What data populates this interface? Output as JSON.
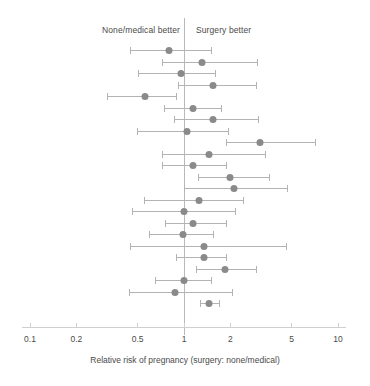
{
  "chart_data": {
    "type": "scatter",
    "subtype": "forest-plot",
    "title": "",
    "xlabel": "Relative risk of pregnancy (surgery: none/medical)",
    "ylabel": "",
    "xscale": "log",
    "xlim": [
      0.1,
      10
    ],
    "xticks": [
      0.1,
      0.2,
      0.5,
      1,
      2,
      5,
      10
    ],
    "xticklabels": [
      "0.1",
      "0.2",
      "0.5",
      "1",
      "2",
      "5",
      "10"
    ],
    "grid": false,
    "legend": "none",
    "reference_line": 1,
    "annotations": [
      {
        "text": "None/medical better",
        "side": "left"
      },
      {
        "text": "Surgery better",
        "side": "right"
      }
    ],
    "marker_color": "#8a8a8a",
    "whisker_color": "#b3b3b3",
    "point_label": "Relative risk",
    "interval_label": "95% confidence interval",
    "points": [
      {
        "rr": 0.8,
        "low": 0.45,
        "high": 1.5
      },
      {
        "rr": 1.3,
        "low": 0.72,
        "high": 3.0
      },
      {
        "rr": 0.95,
        "low": 0.51,
        "high": 1.6
      },
      {
        "rr": 1.55,
        "low": 0.92,
        "high": 2.95
      },
      {
        "rr": 0.56,
        "low": 0.32,
        "high": 0.9
      },
      {
        "rr": 1.15,
        "low": 0.75,
        "high": 1.75
      },
      {
        "rr": 1.55,
        "low": 0.87,
        "high": 3.05
      },
      {
        "rr": 1.05,
        "low": 0.5,
        "high": 1.95
      },
      {
        "rr": 3.1,
        "low": 1.9,
        "high": 7.1
      },
      {
        "rr": 1.45,
        "low": 0.72,
        "high": 3.4
      },
      {
        "rr": 1.15,
        "low": 0.73,
        "high": 1.9
      },
      {
        "rr": 2.0,
        "low": 1.25,
        "high": 3.6
      },
      {
        "rr": 2.1,
        "low": 1.0,
        "high": 4.7
      },
      {
        "rr": 1.25,
        "low": 0.55,
        "high": 2.45
      },
      {
        "rr": 1.0,
        "low": 0.46,
        "high": 2.15
      },
      {
        "rr": 1.15,
        "low": 0.76,
        "high": 1.9
      },
      {
        "rr": 0.98,
        "low": 0.6,
        "high": 1.55
      },
      {
        "rr": 1.35,
        "low": 0.45,
        "high": 4.6
      },
      {
        "rr": 1.35,
        "low": 0.9,
        "high": 1.9
      },
      {
        "rr": 1.85,
        "low": 1.2,
        "high": 2.95
      },
      {
        "rr": 1.0,
        "low": 0.65,
        "high": 1.5
      },
      {
        "rr": 0.88,
        "low": 0.44,
        "high": 2.05
      },
      {
        "rr": 1.45,
        "low": 1.28,
        "high": 1.7
      }
    ]
  }
}
